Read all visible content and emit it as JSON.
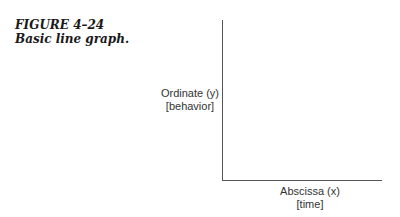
{
  "figure": {
    "number": "FIGURE 4–24",
    "title": "Basic line graph."
  },
  "chart_data": {
    "type": "line",
    "title": "Basic line graph.",
    "ylabel": "Ordinate (y) [behavior]",
    "xlabel": "Abscissa (x) [time]",
    "series": [],
    "grid": false
  },
  "axes": {
    "y_label_line1": "Ordinate (y)",
    "y_label_line2": "[behavior]",
    "x_label_line1": "Abscissa (x)",
    "x_label_line2": "[time]"
  }
}
